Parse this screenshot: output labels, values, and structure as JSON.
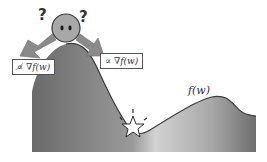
{
  "diagram": {
    "title": "",
    "function_label": "f(w)",
    "left_label": "∝̸ ∇f(w)",
    "right_label": "∝ ∇f(w)",
    "question_marks": [
      "?",
      "?"
    ],
    "elements": [
      {
        "name": "loss-landscape",
        "type": "shaded-curve",
        "description": "gradient-filled hill-valley-hill curve"
      },
      {
        "name": "agent-ball",
        "type": "circle-face",
        "description": "gray ball with two eyes at the peak"
      },
      {
        "name": "left-arrow",
        "type": "arrow",
        "direction": "down-left"
      },
      {
        "name": "right-arrow",
        "type": "arrow",
        "direction": "down-right"
      },
      {
        "name": "minimum-star",
        "type": "star",
        "description": "white star marking the valley minimum with spark lines"
      }
    ],
    "colors": {
      "fill_dark": "#6e6e6e",
      "fill_light": "#c8c8c8",
      "outline": "#3a3a3a",
      "arrow": "#8a8a8a",
      "ball": "#a8a8a8",
      "background": "#ffffff"
    }
  }
}
